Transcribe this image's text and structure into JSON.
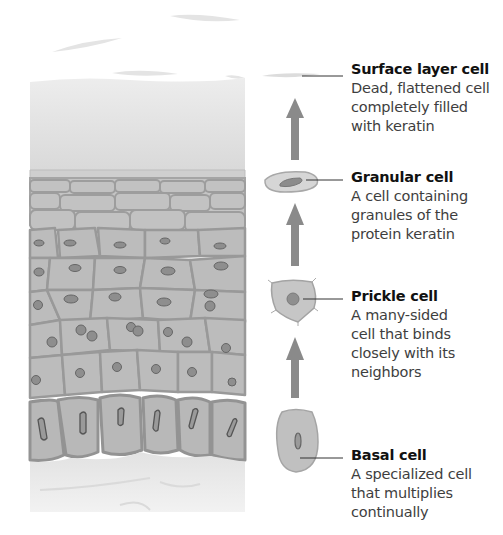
{
  "diagram": {
    "colors": {
      "cell_fill": "#b9b9b9",
      "cell_border": "#8f8f8f",
      "nucleus": "#8a8a8a",
      "arrow": "#8a8a8a",
      "text_title": "#111111",
      "text_desc": "#3e3e3e",
      "leader_line": "#333333"
    },
    "stages": [
      {
        "id": "surface",
        "title": "Surface layer cell",
        "desc_lines": [
          "Dead, flattened cell",
          "completely filled",
          "with keratin"
        ]
      },
      {
        "id": "granular",
        "title": "Granular cell",
        "desc_lines": [
          "A cell containing",
          "granules of the",
          "protein keratin"
        ]
      },
      {
        "id": "prickle",
        "title": "Prickle cell",
        "desc_lines": [
          "A many-sided",
          "cell that binds",
          "closely with its",
          "neighbors"
        ]
      },
      {
        "id": "basal",
        "title": "Basal cell",
        "desc_lines": [
          "A specialized cell",
          "that multiplies",
          "continually"
        ]
      }
    ],
    "arrows": [
      {
        "from": "basal",
        "to": "prickle",
        "direction": "up"
      },
      {
        "from": "prickle",
        "to": "granular",
        "direction": "up"
      },
      {
        "from": "granular",
        "to": "surface",
        "direction": "up"
      }
    ]
  }
}
